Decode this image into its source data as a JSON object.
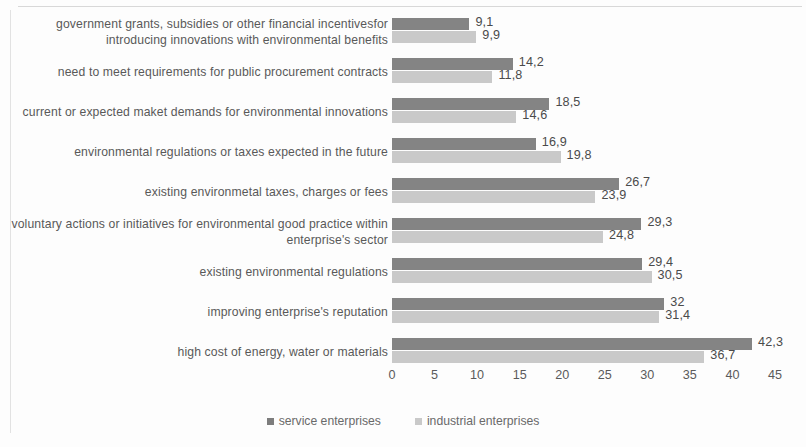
{
  "chart_data": {
    "type": "bar",
    "orientation": "horizontal",
    "title": "",
    "xlabel": "",
    "ylabel": "",
    "xlim": [
      0,
      45
    ],
    "xticks": [
      "0",
      "5",
      "10",
      "15",
      "20",
      "25",
      "30",
      "35",
      "40",
      "45"
    ],
    "grid": false,
    "legend_position": "bottom-center",
    "categories": [
      "government grants, subsidies or other financial incentivesfor introducing innovations with environmental benefits",
      "need to meet requirements for public procurement contracts",
      "current or expected maket demands for environmental innovations",
      "environmental regulations or taxes expected in the future",
      "existing environmetal taxes, charges or fees",
      "voluntary actions or initiatives for environmental good practice within enterprise's sector",
      "existing environmental regulations",
      "improving enterprise's reputation",
      "high cost of energy, water or materials"
    ],
    "series": [
      {
        "name": "service enterprises",
        "color": "#848484",
        "values": [
          9.1,
          14.2,
          18.5,
          16.9,
          26.7,
          29.3,
          29.4,
          32,
          42.3
        ],
        "labels": [
          "9,1",
          "14,2",
          "18,5",
          "16,9",
          "26,7",
          "29,3",
          "29,4",
          "32",
          "42,3"
        ]
      },
      {
        "name": "industrial enterprises",
        "color": "#c9c9c9",
        "values": [
          9.9,
          11.8,
          14.6,
          19.8,
          23.9,
          24.8,
          30.5,
          31.4,
          36.7
        ],
        "labels": [
          "9,9",
          "11,8",
          "14,6",
          "19,8",
          "23,9",
          "24,8",
          "30,5",
          "31,4",
          "36,7"
        ]
      }
    ]
  },
  "legend": {
    "items": [
      {
        "label": "service enterprises"
      },
      {
        "label": "industrial enterprises"
      }
    ]
  }
}
